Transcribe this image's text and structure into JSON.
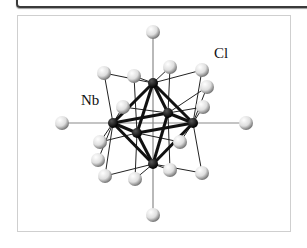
{
  "figure": {
    "labels": {
      "cl": "Cl",
      "nb": "Nb"
    },
    "colors": {
      "nb_atom": "#111111",
      "cl_atom": "#e6e6e6",
      "bond": "#111111",
      "axis": "#888888"
    },
    "nb_atoms": [
      [
        153,
        83
      ],
      [
        113,
        123
      ],
      [
        193,
        123
      ],
      [
        168,
        113
      ],
      [
        137,
        133
      ],
      [
        153,
        164
      ]
    ],
    "cl_atoms": [
      [
        153,
        32
      ],
      [
        104,
        73
      ],
      [
        134,
        76
      ],
      [
        170,
        67
      ],
      [
        202,
        70
      ],
      [
        207,
        87
      ],
      [
        123,
        107
      ],
      [
        203,
        107
      ],
      [
        100,
        142
      ],
      [
        180,
        142
      ],
      [
        98,
        160
      ],
      [
        105,
        176
      ],
      [
        135,
        179
      ],
      [
        170,
        170
      ],
      [
        202,
        173
      ],
      [
        153,
        215
      ],
      [
        62,
        123
      ],
      [
        246,
        123
      ]
    ]
  }
}
